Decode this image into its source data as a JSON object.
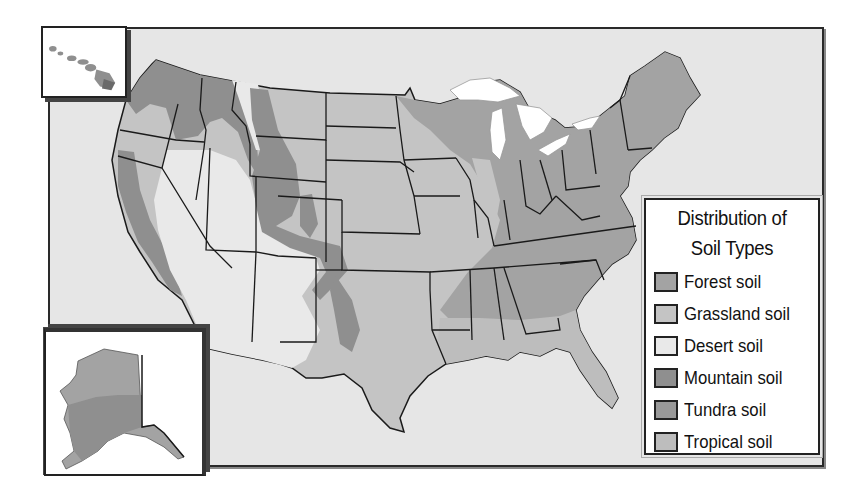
{
  "map": {
    "title_line1": "Distribution of",
    "title_line2": "Soil Types",
    "insets": [
      "Hawaii",
      "Alaska"
    ],
    "background_color": "#e6e6e6",
    "border_color": "#2a2a2a"
  },
  "legend": {
    "items": [
      {
        "label": "Forest soil",
        "color": "#a3a3a3"
      },
      {
        "label": "Grassland soil",
        "color": "#c4c4c4"
      },
      {
        "label": "Desert soil",
        "color": "#e9e9e9"
      },
      {
        "label": "Mountain soil",
        "color": "#8f8f8f"
      },
      {
        "label": "Tundra soil",
        "color": "#999999"
      },
      {
        "label": "Tropical soil",
        "color": "#bdbdbd"
      }
    ]
  },
  "colors": {
    "forest": "#a3a3a3",
    "grassland": "#c4c4c4",
    "desert": "#e9e9e9",
    "mountain": "#8f8f8f",
    "water": "#ffffff",
    "state_border": "#1a1a1a"
  }
}
